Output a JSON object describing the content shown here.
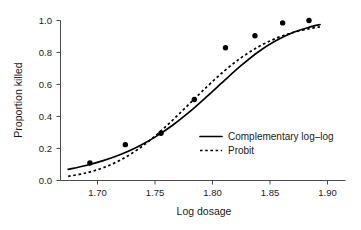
{
  "chart_data": {
    "type": "scatter",
    "title": "",
    "xlabel": "Log dosage",
    "ylabel": "Proportion killed",
    "xlim": [
      1.6745,
      1.8935
    ],
    "ylim": [
      0.0,
      1.0
    ],
    "grid": false,
    "xticks": [
      "1.70",
      "1.75",
      "1.80",
      "1.85",
      "1.90"
    ],
    "xtick_values": [
      1.7,
      1.75,
      1.8,
      1.85,
      1.9
    ],
    "yticks": [
      "0.0",
      "0.2",
      "0.4",
      "0.6",
      "0.8",
      "1.0"
    ],
    "ytick_values": [
      0.0,
      0.2,
      0.4,
      0.6,
      0.8,
      1.0
    ],
    "legend_position": "lower-right",
    "points": {
      "name": "Observed proportion killed",
      "x": [
        1.6934,
        1.7242,
        1.7552,
        1.7842,
        1.8113,
        1.8369,
        1.861,
        1.8839
      ],
      "y": [
        0.109,
        0.224,
        0.295,
        0.506,
        0.83,
        0.905,
        0.985,
        1.0
      ]
    },
    "series": [
      {
        "name": "Complementary log–log",
        "style": "solid",
        "x": [
          1.6745,
          1.69,
          1.705,
          1.72,
          1.735,
          1.75,
          1.765,
          1.78,
          1.795,
          1.81,
          1.825,
          1.84,
          1.855,
          1.87,
          1.885,
          1.8935
        ],
        "y": [
          0.07,
          0.094,
          0.124,
          0.162,
          0.211,
          0.271,
          0.344,
          0.429,
          0.524,
          0.623,
          0.719,
          0.805,
          0.873,
          0.925,
          0.96,
          0.975
        ]
      },
      {
        "name": "Probit",
        "style": "dotted",
        "x": [
          1.6745,
          1.69,
          1.705,
          1.72,
          1.735,
          1.75,
          1.765,
          1.78,
          1.795,
          1.81,
          1.825,
          1.84,
          1.855,
          1.87,
          1.885,
          1.8935
        ],
        "y": [
          0.026,
          0.047,
          0.08,
          0.128,
          0.194,
          0.277,
          0.375,
          0.48,
          0.585,
          0.683,
          0.768,
          0.836,
          0.888,
          0.925,
          0.95,
          0.96
        ]
      }
    ]
  },
  "legend": {
    "items": [
      {
        "label": "Complementary log–log",
        "style": "solid"
      },
      {
        "label": "Probit",
        "style": "dotted"
      }
    ]
  },
  "axes": {
    "x_title": "Log dosage",
    "y_title": "Proportion killed",
    "x_tick_labels": [
      "1.70",
      "1.75",
      "1.80",
      "1.85",
      "1.90"
    ],
    "y_tick_labels": [
      "0.0",
      "0.2",
      "0.4",
      "0.6",
      "0.8",
      "1.0"
    ]
  }
}
